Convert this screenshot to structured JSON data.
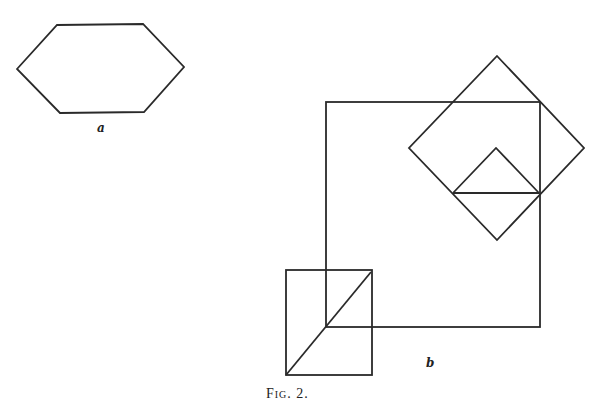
{
  "figure": {
    "caption": "Fig. 2.",
    "labels": {
      "a": "a",
      "b": "b"
    }
  },
  "shapes": {
    "hexagon_a": {
      "points": "17,69 57,25 143,24 184,67 144,112 60,113"
    },
    "large_square": {
      "x": 326,
      "y": 102,
      "width": 214,
      "height": 225
    },
    "large_diamond": {
      "points": "497,56 584,148 497,240 409,148"
    },
    "small_triangle": {
      "points": "453,193 496,148 539,193"
    },
    "triangle_base": {
      "x1": 453,
      "y1": 193,
      "x2": 539,
      "y2": 193
    },
    "small_rectangle": {
      "x": 286,
      "y": 270,
      "width": 86,
      "height": 105
    },
    "rectangle_diagonal": {
      "x1": 286,
      "y1": 375,
      "x2": 371,
      "y2": 272
    }
  }
}
